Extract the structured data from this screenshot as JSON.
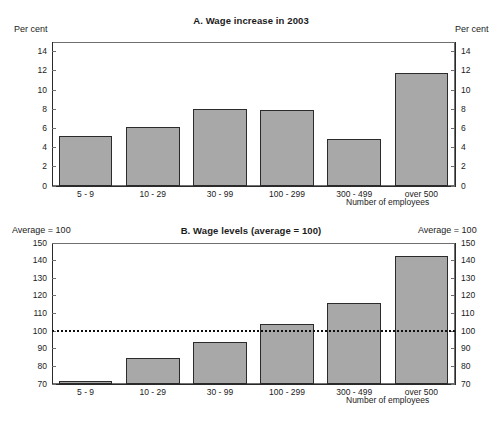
{
  "figure": {
    "background": "#ffffff",
    "bar_fill": "#a8a8a8",
    "bar_edge": "#2b2b2b",
    "axis_color": "#6f6f6f"
  },
  "chart_data": [
    {
      "type": "bar",
      "id": "panel-a",
      "title": "A. Wage increase in 2003",
      "xlabel": "Number of employees",
      "ylabel": "Per cent",
      "ylabel_right": "Per cent",
      "categories": [
        "5 - 9",
        "10 - 29",
        "30 - 99",
        "100 - 299",
        "300 - 499",
        "over 500"
      ],
      "values": [
        5.2,
        6.1,
        8.0,
        7.9,
        4.9,
        11.8
      ],
      "ylim": [
        0,
        15
      ],
      "yticks": [
        0,
        2,
        4,
        6,
        8,
        10,
        12,
        14
      ],
      "ytick_labels": [
        "0",
        "2",
        "4",
        "6",
        "8",
        "10",
        "12",
        "14"
      ],
      "grid": false,
      "legend": "none"
    },
    {
      "type": "bar",
      "id": "panel-b",
      "title": "B. Wage levels (average = 100)",
      "xlabel": "Number of employees",
      "ylabel": "Average = 100",
      "ylabel_right": "Average = 100",
      "categories": [
        "5 - 9",
        "10 - 29",
        "30 - 99",
        "100 - 299",
        "300 - 499",
        "over 500"
      ],
      "values": [
        71.5,
        85.0,
        94.0,
        104.0,
        116.0,
        142.5
      ],
      "ylim": [
        70,
        150
      ],
      "yticks": [
        70,
        80,
        90,
        100,
        110,
        120,
        130,
        140,
        150
      ],
      "ytick_labels": [
        "70",
        "80",
        "90",
        "100",
        "110",
        "120",
        "130",
        "140",
        "150"
      ],
      "reference_line": {
        "value": 100,
        "style": "dotted",
        "color": "#101010"
      },
      "grid": false,
      "legend": "none"
    }
  ]
}
